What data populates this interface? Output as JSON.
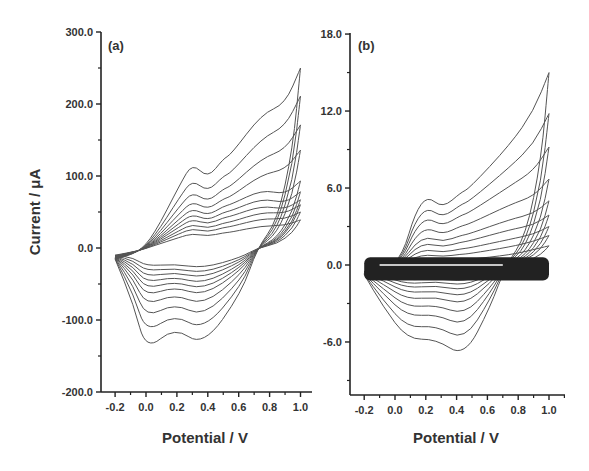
{
  "chart_data": [
    {
      "type": "line",
      "panel": "(a)",
      "title": "",
      "xlabel": "Potential / V",
      "ylabel": "Current / μA",
      "xlim": [
        -0.3,
        1.1
      ],
      "ylim": [
        -200,
        300
      ],
      "xticks": [
        "-0.2",
        "0.0",
        "0.2",
        "0.4",
        "0.6",
        "0.8",
        "1.0"
      ],
      "yticks": [
        "300.0",
        "200.0",
        "100.0",
        "0.0",
        "-100.0",
        "-200.0"
      ],
      "grid": false,
      "legend": null,
      "description": "Cyclic voltammograms at increasing scan rates (10 nested cycles). Anodic peaks near 0.3 V and 0.55 V, cathodic peaks near 0.0 V and 0.37 V.",
      "series_summary": {
        "num_cycles": 10,
        "anodic_peak_1_V": 0.3,
        "anodic_peak_2_V": 0.55,
        "cathodic_peak_1_V": 0.0,
        "cathodic_peak_2_V": 0.37,
        "max_current_at_1V_uA": [
          39,
          50,
          60,
          67,
          78,
          93,
          136,
          171,
          211,
          250
        ],
        "anodic_peak_1_uA": [
          20,
          27,
          33,
          40,
          47,
          55,
          65,
          78,
          95,
          118
        ],
        "cathodic_peak_1_uA": [
          -25,
          -32,
          -40,
          -48,
          -57,
          -67,
          -80,
          -97,
          -118,
          -143
        ],
        "cathodic_peak_2_uA": [
          -28,
          -35,
          -42,
          -50,
          -58,
          -67,
          -80,
          -96,
          -115,
          -137
        ]
      }
    },
    {
      "type": "line",
      "panel": "(b)",
      "title": "",
      "xlabel": "Potential / V",
      "ylabel": "",
      "xlim": [
        -0.3,
        1.1
      ],
      "ylim": [
        -10.3,
        18
      ],
      "xticks": [
        "-0.2",
        "0.0",
        "0.2",
        "0.4",
        "0.6",
        "0.8",
        "1.0"
      ],
      "yticks": [
        "18.0",
        "12.0",
        "6.0",
        "0.0",
        "-6.0"
      ],
      "grid": false,
      "legend": null,
      "description": "Cyclic voltammograms with many overlapping low-current cycles forming a dense band near 0 μA and increasing scan-rate cycles. Anodic peaks near 0.21 V and 0.48 V, cathodic peaks near 0.08 V and 0.45 V.",
      "series_summary": {
        "num_cycles_distinct": 9,
        "anodic_peak_1_V": 0.21,
        "anodic_peak_2_V": 0.48,
        "cathodic_peak_1_V": 0.08,
        "cathodic_peak_2_V": 0.45,
        "max_current_at_1V_uA": [
          1.5,
          2.3,
          3.0,
          3.9,
          5.0,
          6.7,
          9.2,
          11.8,
          15.0
        ],
        "anodic_peak_1_uA": [
          0.4,
          0.8,
          1.2,
          1.7,
          2.2,
          2.9,
          3.7,
          4.5,
          5.4
        ],
        "cathodic_peak_1_uA": [
          -1.2,
          -1.5,
          -1.8,
          -2.2,
          -2.7,
          -3.3,
          -4.0,
          -4.9,
          -5.8
        ],
        "cathodic_peak_2_uA": [
          -1.3,
          -1.6,
          -2.0,
          -2.5,
          -3.1,
          -3.9,
          -4.8,
          -5.9,
          -7.2
        ]
      }
    }
  ],
  "figure": {
    "panel_a": {
      "label": "(a)",
      "y_axis_title": "Current / μA",
      "x_axis_title": "Potential / V",
      "y_tick_labels": [
        "300.0",
        "200.0",
        "100.0",
        "0.0",
        "-100.0",
        "-200.0"
      ],
      "x_tick_labels": [
        "-0.2",
        "0.0",
        "0.2",
        "0.4",
        "0.6",
        "0.8",
        "1.0"
      ]
    },
    "panel_b": {
      "label": "(b)",
      "x_axis_title": "Potential / V",
      "y_tick_labels": [
        "18.0",
        "12.0",
        "6.0",
        "0.0",
        "-6.0"
      ],
      "x_tick_labels": [
        "-0.2",
        "0.0",
        "0.2",
        "0.4",
        "0.6",
        "0.8",
        "1.0"
      ]
    },
    "colors": {
      "axis": "#222222",
      "curve": "#555555",
      "text": "#333333"
    }
  }
}
